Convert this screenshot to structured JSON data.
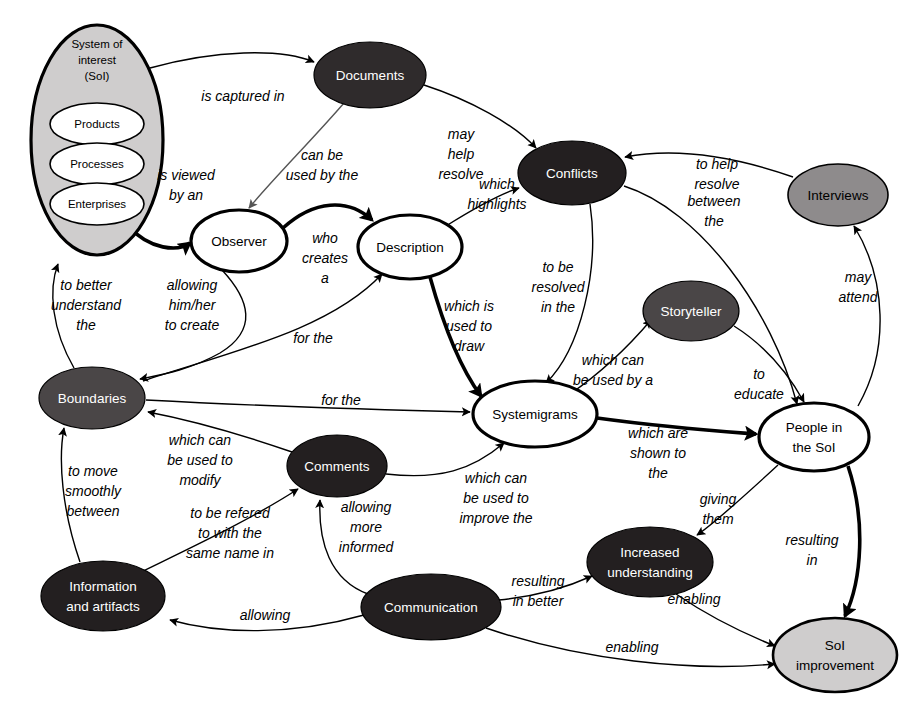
{
  "diagram": {
    "type": "systemigram",
    "background_color": "#ffffff",
    "palette": {
      "white": "#ffffff",
      "black": "#231f20",
      "dark": "#2f2b2c",
      "mid": "#4a4647",
      "gray": "#8e8b8c",
      "light_gray": "#cfcdcd",
      "stroke": "#000000"
    }
  },
  "container": {
    "name": "system-of-interest",
    "label_lines": [
      "System of",
      "interest",
      "(SoI)"
    ],
    "fill": "#cfcdcd",
    "cx": 97,
    "cy": 140,
    "rx": 66,
    "ry": 115,
    "children": [
      {
        "name": "products",
        "label": "Products",
        "cx": 97,
        "cy": 124,
        "rx": 47,
        "ry": 21
      },
      {
        "name": "processes",
        "label": "Processes",
        "cx": 97,
        "cy": 164,
        "rx": 47,
        "ry": 21
      },
      {
        "name": "enterprises",
        "label": "Enterprises",
        "cx": 97,
        "cy": 204,
        "rx": 47,
        "ry": 21
      }
    ]
  },
  "nodes": [
    {
      "id": "documents",
      "label_lines": [
        "Documents"
      ],
      "cx": 370,
      "cy": 75,
      "rx": 56,
      "ry": 33,
      "style": "dark",
      "text": "light"
    },
    {
      "id": "conflicts",
      "label_lines": [
        "Conflicts"
      ],
      "cx": 572,
      "cy": 173,
      "rx": 54,
      "ry": 32,
      "style": "black",
      "text": "light"
    },
    {
      "id": "interviews",
      "label_lines": [
        "Interviews"
      ],
      "cx": 838,
      "cy": 195,
      "rx": 50,
      "ry": 31,
      "style": "gray",
      "text": "dark"
    },
    {
      "id": "observer",
      "label_lines": [
        "Observer"
      ],
      "cx": 239,
      "cy": 241,
      "rx": 48,
      "ry": 31,
      "style": "white",
      "text": "dark"
    },
    {
      "id": "description",
      "label_lines": [
        "Description"
      ],
      "cx": 410,
      "cy": 247,
      "rx": 52,
      "ry": 32,
      "style": "white",
      "text": "dark"
    },
    {
      "id": "storyteller",
      "label_lines": [
        "Storyteller"
      ],
      "cx": 691,
      "cy": 311,
      "rx": 48,
      "ry": 30,
      "style": "mid",
      "text": "light"
    },
    {
      "id": "boundaries",
      "label_lines": [
        "Boundaries"
      ],
      "cx": 92,
      "cy": 398,
      "rx": 53,
      "ry": 31,
      "style": "mid",
      "text": "light"
    },
    {
      "id": "systemigrams",
      "label_lines": [
        "Systemigrams"
      ],
      "cx": 535,
      "cy": 414,
      "rx": 62,
      "ry": 33,
      "style": "white",
      "text": "dark"
    },
    {
      "id": "people",
      "label_lines": [
        "People in",
        "the SoI"
      ],
      "cx": 814,
      "cy": 437,
      "rx": 55,
      "ry": 34,
      "style": "white",
      "text": "dark"
    },
    {
      "id": "comments",
      "label_lines": [
        "Comments"
      ],
      "cx": 337,
      "cy": 466,
      "rx": 50,
      "ry": 31,
      "style": "black",
      "text": "light"
    },
    {
      "id": "increased",
      "label_lines": [
        "Increased",
        "understanding"
      ],
      "cx": 650,
      "cy": 562,
      "rx": 63,
      "ry": 35,
      "style": "black",
      "text": "light"
    },
    {
      "id": "info",
      "label_lines": [
        "Information",
        "and artifacts"
      ],
      "cx": 103,
      "cy": 596,
      "rx": 62,
      "ry": 35,
      "style": "black",
      "text": "light"
    },
    {
      "id": "communication",
      "label_lines": [
        "Communication"
      ],
      "cx": 431,
      "cy": 607,
      "rx": 70,
      "ry": 33,
      "style": "black",
      "text": "light"
    },
    {
      "id": "soi_improve",
      "label_lines": [
        "SoI",
        "improvement"
      ],
      "cx": 835,
      "cy": 655,
      "rx": 62,
      "ry": 37,
      "style": "ltgray",
      "text": "dark"
    }
  ],
  "edges": [
    {
      "id": "e1",
      "from": "system-of-interest",
      "to": "documents",
      "label_lines": [
        "is captured in"
      ],
      "lx": 243,
      "ly": 97,
      "weight": "thin"
    },
    {
      "id": "e2",
      "from": "system-of-interest",
      "to": "observer",
      "label_lines": [
        "is viewed",
        "by an"
      ],
      "lx": 186,
      "ly": 184,
      "weight": "thick"
    },
    {
      "id": "e3",
      "from": "documents",
      "to": "observer",
      "label_lines": [
        "can be",
        "used by the"
      ],
      "lx": 322,
      "ly": 166,
      "weight": "gray"
    },
    {
      "id": "e4",
      "from": "documents",
      "to": "conflicts",
      "label_lines": [
        "may",
        "help",
        "resolve"
      ],
      "lx": 461,
      "ly": 155,
      "weight": "thin"
    },
    {
      "id": "e5",
      "from": "observer",
      "to": "description",
      "label_lines": [
        "who",
        "creates",
        "a"
      ],
      "lx": 325,
      "ly": 255,
      "weight": "thick"
    },
    {
      "id": "e6",
      "from": "description",
      "to": "conflicts",
      "label_lines": [
        "which",
        "highlights"
      ],
      "lx": 497,
      "ly": 195,
      "weight": "thin"
    },
    {
      "id": "e7",
      "from": "conflicts",
      "to": "systemigrams",
      "label_lines": [
        "to be",
        "resolved",
        "in the"
      ],
      "lx": 558,
      "ly": 289,
      "weight": "thin"
    },
    {
      "id": "e8",
      "from": "conflicts",
      "to": "people",
      "label_lines": [
        "between",
        "the"
      ],
      "lx": 714,
      "ly": 212,
      "weight": "thin"
    },
    {
      "id": "e9",
      "from": "interviews",
      "to": "conflicts",
      "label_lines": [
        "to help",
        "resolve"
      ],
      "lx": 717,
      "ly": 175,
      "weight": "thin"
    },
    {
      "id": "e10",
      "from": "people",
      "to": "interviews",
      "label_lines": [
        "may",
        "attend"
      ],
      "lx": 858,
      "ly": 288,
      "weight": "thin"
    },
    {
      "id": "e11",
      "from": "observer",
      "to": "boundaries",
      "label_lines": [
        "allowing",
        "him/her",
        "to create"
      ],
      "lx": 192,
      "ly": 306,
      "weight": "thin"
    },
    {
      "id": "e12",
      "from": "boundaries",
      "to": "system-of-interest",
      "label_lines": [
        "to better",
        "understand",
        "the"
      ],
      "lx": 86,
      "ly": 306,
      "weight": "thin"
    },
    {
      "id": "e13",
      "from": "boundaries",
      "to": "description",
      "label_lines": [
        "for the"
      ],
      "lx": 313,
      "ly": 339,
      "weight": "thin"
    },
    {
      "id": "e14",
      "from": "description",
      "to": "systemigrams",
      "label_lines": [
        "which is",
        "used to",
        "draw"
      ],
      "lx": 469,
      "ly": 327,
      "weight": "thick"
    },
    {
      "id": "e15",
      "from": "systemigrams",
      "to": "storyteller",
      "label_lines": [
        "which can",
        "be used by a"
      ],
      "lx": 613,
      "ly": 371,
      "weight": "thin"
    },
    {
      "id": "e16",
      "from": "storyteller",
      "to": "people",
      "label_lines": [
        "to",
        "educate"
      ],
      "lx": 759,
      "ly": 385,
      "weight": "thin"
    },
    {
      "id": "e17",
      "from": "boundaries",
      "to": "systemigrams",
      "label_lines": [
        "for the"
      ],
      "lx": 341,
      "ly": 401,
      "weight": "thin"
    },
    {
      "id": "e18",
      "from": "systemigrams",
      "to": "people",
      "label_lines": [
        "which are",
        "shown to",
        "the"
      ],
      "lx": 658,
      "ly": 449,
      "weight": "thick"
    },
    {
      "id": "e19",
      "from": "comments",
      "to": "boundaries",
      "label_lines": [
        "which can",
        "be used to",
        "modify"
      ],
      "lx": 200,
      "ly": 455,
      "weight": "thin"
    },
    {
      "id": "e20",
      "from": "comments",
      "to": "systemigrams",
      "label_lines": [
        "which can",
        "be used to",
        "improve the"
      ],
      "lx": 496,
      "ly": 493,
      "weight": "thin"
    },
    {
      "id": "e21",
      "from": "people",
      "to": "increased",
      "label_lines": [
        "giving",
        "them"
      ],
      "lx": 718,
      "ly": 510,
      "weight": "thin"
    },
    {
      "id": "e22",
      "from": "people",
      "to": "soi_improve",
      "label_lines": [
        "resulting",
        "in"
      ],
      "lx": 812,
      "ly": 551,
      "weight": "thick"
    },
    {
      "id": "e23",
      "from": "info",
      "to": "boundaries",
      "label_lines": [
        "to move",
        "smoothly",
        "between"
      ],
      "lx": 93,
      "ly": 492,
      "weight": "thin"
    },
    {
      "id": "e24",
      "from": "info",
      "to": "comments",
      "label_lines": [
        "to be refered",
        "to with the",
        "same name in"
      ],
      "lx": 230,
      "ly": 534,
      "weight": "thin"
    },
    {
      "id": "e25",
      "from": "communication",
      "to": "comments",
      "label_lines": [
        "allowing",
        "more",
        "informed"
      ],
      "lx": 366,
      "ly": 528,
      "weight": "thin"
    },
    {
      "id": "e26",
      "from": "communication",
      "to": "info",
      "label_lines": [
        "allowing"
      ],
      "lx": 265,
      "ly": 616,
      "weight": "thin"
    },
    {
      "id": "e27",
      "from": "communication",
      "to": "increased",
      "label_lines": [
        "resulting",
        "in better"
      ],
      "lx": 538,
      "ly": 592,
      "weight": "thin"
    },
    {
      "id": "e28",
      "from": "increased",
      "to": "soi_improve",
      "label_lines": [
        "enabling"
      ],
      "lx": 694,
      "ly": 600,
      "weight": "thin"
    },
    {
      "id": "e29",
      "from": "communication",
      "to": "soi_improve",
      "label_lines": [
        "enabling"
      ],
      "lx": 632,
      "ly": 648,
      "weight": "thin"
    }
  ]
}
